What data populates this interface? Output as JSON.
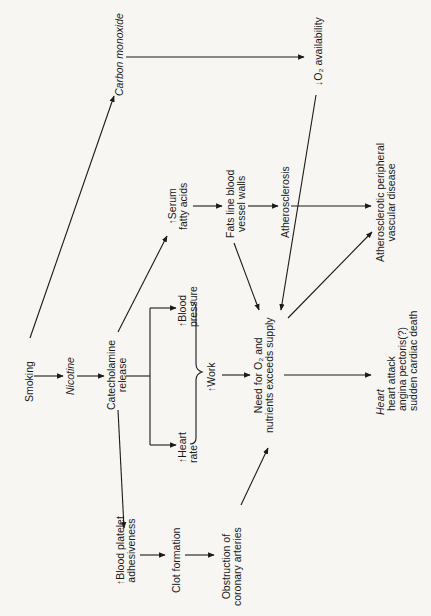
{
  "diagram": {
    "orientation": "rotated-90-ccw",
    "nodes": {
      "smoking": {
        "lines": [
          "Smoking"
        ]
      },
      "nicotine": {
        "lines": [
          "Nicotine"
        ],
        "italic": true
      },
      "carbon_monoxide": {
        "lines": [
          "Carbon monoxide"
        ],
        "italic": true
      },
      "catecholamine": {
        "lines": [
          "Catecholamine",
          "release"
        ]
      },
      "serum_fatty_acids": {
        "lines": [
          "↑Serum",
          "fatty acids"
        ]
      },
      "fats_line": {
        "lines": [
          "Fats line blood",
          "vessel walls"
        ]
      },
      "atherosclerosis": {
        "lines": [
          "Atherosclerosis"
        ]
      },
      "o2_availability": {
        "lines": [
          "↓O₂ availability"
        ]
      },
      "blood_pressure": {
        "lines": [
          "↑Blood",
          "pressure"
        ]
      },
      "heart_rate": {
        "lines": [
          "↑Heart",
          "rate"
        ]
      },
      "work": {
        "lines": [
          "↑Work"
        ]
      },
      "need_o2": {
        "lines": [
          "Need for O₂ and",
          "nutrients exceeds supply"
        ]
      },
      "peripheral": {
        "lines": [
          "Atherosclerotic peripheral",
          "vascular disease"
        ]
      },
      "platelet": {
        "lines": [
          "↑Blood platelet",
          "adhesiveness"
        ]
      },
      "clot": {
        "lines": [
          "Clot formation"
        ]
      },
      "obstruction": {
        "lines": [
          "Obstruction of",
          "coronary arteries"
        ]
      },
      "heart": {
        "lines": [
          "Heart",
          "heart attack",
          "angina pectoris(?)",
          "sudden cardiac death"
        ]
      }
    },
    "edges": [
      [
        "Smoking",
        "Nicotine"
      ],
      [
        "Smoking",
        "Carbon monoxide"
      ],
      [
        "Nicotine",
        "Catecholamine release"
      ],
      [
        "Carbon monoxide",
        "O2 availability"
      ],
      [
        "Catecholamine release",
        "Serum fatty acids"
      ],
      [
        "Catecholamine release",
        "Blood pressure"
      ],
      [
        "Catecholamine release",
        "Heart rate"
      ],
      [
        "Catecholamine release",
        "Blood platelet adhesiveness"
      ],
      [
        "Serum fatty acids",
        "Fats line blood vessel walls"
      ],
      [
        "Fats line blood vessel walls",
        "Atherosclerosis"
      ],
      [
        "Fats line blood vessel walls",
        "Need for O2"
      ],
      [
        "Atherosclerosis",
        "Atherosclerotic peripheral vascular disease"
      ],
      [
        "O2 availability",
        "Need for O2"
      ],
      [
        "Work",
        "Need for O2"
      ],
      [
        "Need for O2",
        "Atherosclerotic peripheral vascular disease"
      ],
      [
        "Need for O2",
        "Heart"
      ],
      [
        "Blood platelet adhesiveness",
        "Clot formation"
      ],
      [
        "Clot formation",
        "Obstruction of coronary arteries"
      ],
      [
        "Obstruction of coronary arteries",
        "Need for O2"
      ]
    ]
  }
}
